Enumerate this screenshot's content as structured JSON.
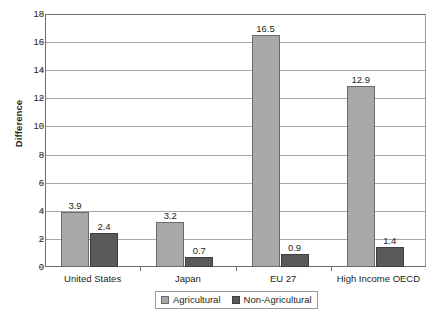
{
  "chart_data": {
    "type": "bar",
    "title": "",
    "subtitle": "",
    "xlabel": "",
    "ylabel": "Difference",
    "ylim": [
      0,
      18
    ],
    "ytick_step": 2,
    "yticks": [
      18,
      16,
      14,
      12,
      10,
      8,
      6,
      4,
      2,
      0
    ],
    "grid": "horizontal",
    "legend_position": "bottom-center",
    "categories": [
      "United States",
      "Japan",
      "EU 27",
      "High Income OECD"
    ],
    "series": [
      {
        "name": "Agricultural",
        "color": "#A8A8A8",
        "values": [
          3.9,
          3.2,
          16.5,
          12.9
        ],
        "labels": [
          "3.9",
          "3.2",
          "16.5",
          "12.9"
        ]
      },
      {
        "name": "Non-Agricultural",
        "color": "#595959",
        "values": [
          2.4,
          0.7,
          0.9,
          1.4
        ],
        "labels": [
          "2.4",
          "0.7",
          "0.9",
          "1.4"
        ]
      }
    ]
  },
  "axis": {
    "y_title": "Difference"
  },
  "legend": {
    "items": [
      {
        "label": "Agricultural"
      },
      {
        "label": "Non-Agricultural"
      }
    ]
  }
}
